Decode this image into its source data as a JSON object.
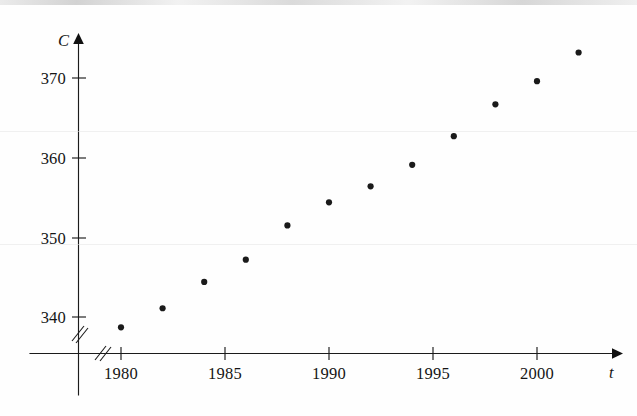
{
  "figure": {
    "background_color": "#fefefe",
    "ink_color": "#1a1a1a"
  },
  "chart_data": {
    "type": "scatter",
    "title": "",
    "subtitle": "",
    "xlabel": "t",
    "ylabel": "C",
    "x": [
      1980,
      1982,
      1984,
      1986,
      1988,
      1990,
      1992,
      1994,
      1996,
      1998,
      2000,
      2002
    ],
    "values": [
      338.7,
      341.1,
      344.4,
      347.2,
      351.5,
      354.4,
      356.4,
      359.1,
      362.7,
      366.7,
      369.6,
      373.2
    ],
    "points": [
      {
        "x": 1980,
        "y": 338.7
      },
      {
        "x": 1982,
        "y": 341.1
      },
      {
        "x": 1984,
        "y": 344.4
      },
      {
        "x": 1986,
        "y": 347.2
      },
      {
        "x": 1988,
        "y": 351.5
      },
      {
        "x": 1990,
        "y": 354.4
      },
      {
        "x": 1992,
        "y": 356.4
      },
      {
        "x": 1994,
        "y": 359.1
      },
      {
        "x": 1996,
        "y": 362.7
      },
      {
        "x": 1998,
        "y": 366.7
      },
      {
        "x": 2000,
        "y": 369.6
      },
      {
        "x": 2002,
        "y": 373.2
      }
    ],
    "xlim": [
      1977.5,
      2004
    ],
    "ylim": [
      336,
      375
    ],
    "xticks": [
      1980,
      1985,
      1990,
      1995,
      2000
    ],
    "xtick_labels": [
      "1980",
      "1985",
      "1990",
      "1995",
      "2000"
    ],
    "yticks": [
      340,
      350,
      360,
      370
    ],
    "ytick_labels": [
      "340",
      "350",
      "360",
      "370"
    ],
    "grid": false,
    "legend": null,
    "axis_break_x": true,
    "axis_break_y": true,
    "axis_arrows": true,
    "marker": "filled-circle",
    "marker_size": 4
  },
  "axes": {
    "y_axis_label": "C",
    "x_axis_label": "t"
  },
  "icons": {
    "x_axis_arrow": "arrow-right-icon",
    "y_axis_arrow": "arrow-up-icon",
    "x_axis_break": "axis-break-icon",
    "y_axis_break": "axis-break-icon"
  }
}
